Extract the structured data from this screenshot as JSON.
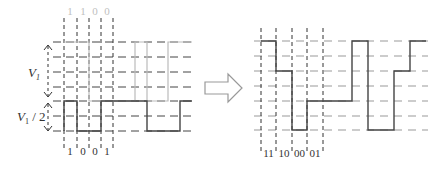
{
  "figure": {
    "left_diagram": {
      "top_bits_label": [
        "1",
        "1",
        "0",
        "0"
      ],
      "bottom_bits_label": [
        "1",
        "0",
        "0",
        "1"
      ],
      "v1_label": "V",
      "v1_subscript": "1",
      "v1_half_label_prefix": "V",
      "v1_half_subscript": "1",
      "v1_half_suffix": " / 2"
    },
    "arrow": {
      "direction": "right"
    },
    "right_diagram": {
      "symbol_labels": [
        "11",
        "10",
        "00",
        "01"
      ]
    }
  },
  "colors": {
    "dark_line": "#333333",
    "light_line": "#bbbbbb",
    "dash_line": "#444444",
    "grid_dash_light": "#999999",
    "light_text": "#c0c0c0",
    "text": "#333333",
    "arrow_stroke": "#999999"
  }
}
